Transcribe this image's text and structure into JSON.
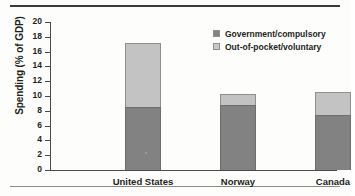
{
  "chart_data": {
    "type": "bar",
    "subtype": "stacked-vertical",
    "title": "",
    "subtitle": "",
    "xlabel": "",
    "ylabel": "Spending (% of GDP)",
    "categories": [
      "United States",
      "Norway",
      "Canada"
    ],
    "series": [
      {
        "name": "Government/compulsory",
        "color": "#828282",
        "values": [
          8.5,
          8.8,
          7.5
        ]
      },
      {
        "name": "Out-of-pocket/voluntary",
        "color": "#c3c3c3",
        "values": [
          8.7,
          1.5,
          3.1
        ]
      }
    ],
    "totals": [
      17.2,
      10.3,
      10.6
    ],
    "ylim": [
      0,
      20
    ],
    "ytick_step": 2,
    "yticks": [
      "20",
      "18",
      "16",
      "14",
      "12",
      "10",
      "8",
      "6",
      "4",
      "2",
      "0"
    ],
    "grid": false,
    "legend_position": "top-right",
    "legend": [
      "Government/compulsory",
      "Out-of-pocket/voluntary"
    ]
  },
  "figure": {
    "rule_top_color": "#3b3b3b",
    "rule_bottom_color": "#8b8b8b",
    "background": "#fdfdfc"
  }
}
